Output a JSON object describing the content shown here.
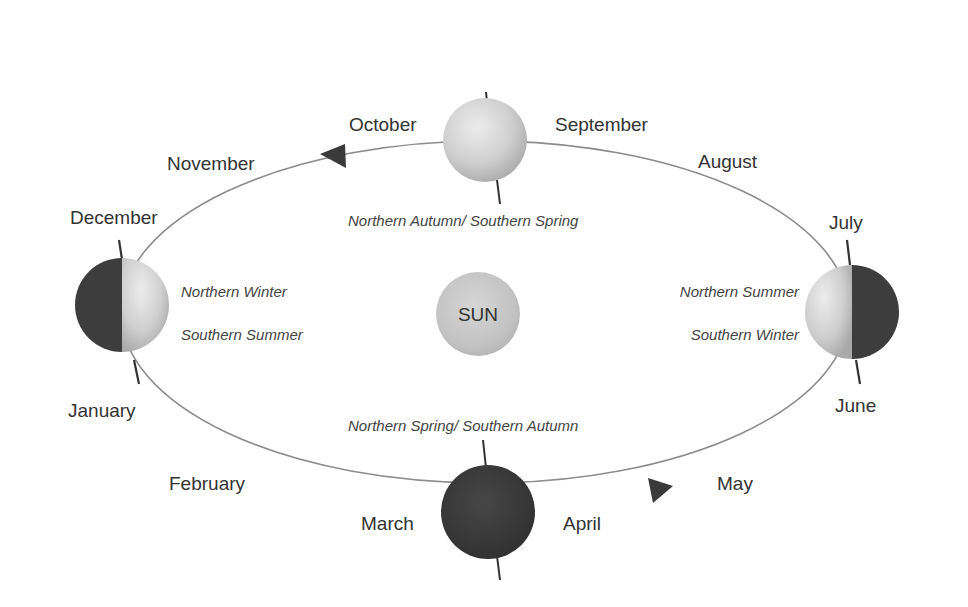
{
  "diagram": {
    "colors": {
      "orbit_line": "#8a8a8a",
      "sun_fill": "#c8c8c8",
      "earth_light": "#d4d4d4",
      "earth_dark": "#3d3d3d",
      "arrow": "#3a3a3a",
      "text": "#333333"
    },
    "sun": {
      "label": "SUN"
    },
    "months": {
      "january": "January",
      "february": "February",
      "march": "March",
      "april": "April",
      "may": "May",
      "june": "June",
      "july": "July",
      "august": "August",
      "september": "September",
      "october": "October",
      "november": "November",
      "december": "December"
    },
    "seasons": {
      "top": "Northern Autumn/ Southern Spring",
      "bottom": "Northern Spring/ Southern Autumn",
      "left_north": "Northern Winter",
      "left_south": "Southern Summer",
      "right_north": "Northern Summer",
      "right_south": "Southern Winter"
    },
    "earths": [
      {
        "position": "top",
        "state": "fully-lit"
      },
      {
        "position": "bottom",
        "state": "fully-dark"
      },
      {
        "position": "left",
        "state": "left-half-dark"
      },
      {
        "position": "right",
        "state": "right-half-dark"
      }
    ],
    "arrows": [
      {
        "position": "upper-left",
        "direction": "counterclockwise"
      },
      {
        "position": "lower-right",
        "direction": "counterclockwise"
      }
    ]
  }
}
